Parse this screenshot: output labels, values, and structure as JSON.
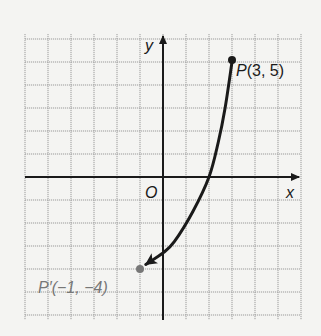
{
  "chart_data": {
    "type": "diagram",
    "title": "",
    "xlabel": "x",
    "ylabel": "y",
    "origin_label": "O",
    "xlim": [
      -6,
      6
    ],
    "ylim": [
      -6,
      6
    ],
    "grid": true,
    "grid_step": 1,
    "points": [
      {
        "name": "P",
        "label": "P(3, 5)",
        "x": 3,
        "y": 5,
        "color": "#1a1a1a"
      },
      {
        "name": "P'",
        "label": "P′(−1, −4)",
        "x": -1,
        "y": -4,
        "color": "#777777"
      }
    ],
    "curve": {
      "from": "P",
      "to": "P'",
      "arrow_at_end": true,
      "path_points": [
        [
          3,
          5
        ],
        [
          2.7,
          3
        ],
        [
          2.4,
          1.5
        ],
        [
          2,
          0
        ],
        [
          1.3,
          -1.5
        ],
        [
          0.5,
          -2.8
        ],
        [
          0,
          -3.3
        ],
        [
          -0.75,
          -3.8
        ]
      ]
    }
  },
  "labels": {
    "x_axis": "x",
    "y_axis": "y",
    "origin": "O",
    "p_label_letter": "P",
    "p_label_coords": "(3, 5)",
    "p_prime_label": "P′(−1, −4)"
  },
  "colors": {
    "grid": "#9a9a9a",
    "axis": "#1a1a1a",
    "curve": "#1a1a1a",
    "p_prime": "#777777",
    "background": "#f4f4f2"
  }
}
